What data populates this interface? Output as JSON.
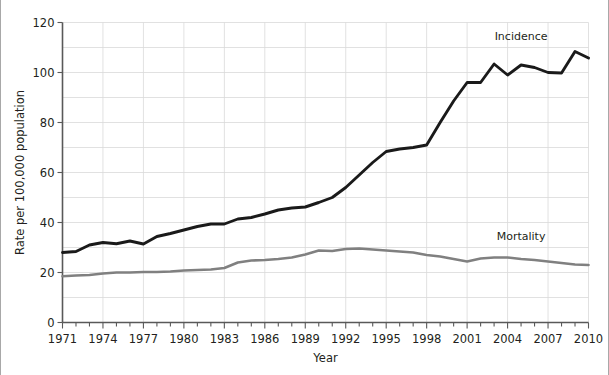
{
  "chart_data": {
    "type": "line",
    "title": "",
    "xlabel": "Year",
    "ylabel": "Rate per 100,000 population",
    "xlim": [
      1971,
      2010
    ],
    "ylim": [
      0,
      120
    ],
    "y_ticks": [
      0,
      20,
      40,
      60,
      80,
      100,
      120
    ],
    "y_gridlines": [
      10,
      20,
      30,
      40,
      50,
      60,
      70,
      80,
      90,
      100,
      110,
      120
    ],
    "y_tick_labels": [
      "0",
      "20",
      "40",
      "60",
      "80",
      "100",
      "120"
    ],
    "x_ticks": [
      1971,
      1972,
      1973,
      1974,
      1975,
      1976,
      1977,
      1978,
      1979,
      1980,
      1981,
      1982,
      1983,
      1984,
      1985,
      1986,
      1987,
      1988,
      1989,
      1990,
      1991,
      1992,
      1993,
      1994,
      1995,
      1996,
      1997,
      1998,
      1999,
      2000,
      2001,
      2002,
      2003,
      2004,
      2005,
      2006,
      2007,
      2008,
      2009,
      2010
    ],
    "x_tick_labels": [
      "1971",
      "1974",
      "1977",
      "1980",
      "1983",
      "1986",
      "1989",
      "1992",
      "1995",
      "1998",
      "2001",
      "2004",
      "2007",
      "2010"
    ],
    "x_labeled_ticks": [
      1971,
      1974,
      1977,
      1980,
      1983,
      1986,
      1989,
      1992,
      1995,
      1998,
      2001,
      2004,
      2007,
      2010
    ],
    "x_gridlines": [
      1971,
      1974,
      1977,
      1980,
      1983,
      1986,
      1989,
      1992,
      1995,
      1998,
      2001,
      2004,
      2007,
      2010
    ],
    "grid": true,
    "legend_position": "inline-annotation",
    "x": [
      1971,
      1972,
      1973,
      1974,
      1975,
      1976,
      1977,
      1978,
      1979,
      1980,
      1981,
      1982,
      1983,
      1984,
      1985,
      1986,
      1987,
      1988,
      1989,
      1990,
      1991,
      1992,
      1993,
      1994,
      1995,
      1996,
      1997,
      1998,
      1999,
      2000,
      2001,
      2002,
      2003,
      2004,
      2005,
      2006,
      2007,
      2008,
      2009,
      2010
    ],
    "series": [
      {
        "name": "Incidence",
        "color": "#1a1a1a",
        "values": [
          28.0,
          28.4,
          31.0,
          32.0,
          31.5,
          32.6,
          31.4,
          34.4,
          35.6,
          37.0,
          38.4,
          39.4,
          39.4,
          41.4,
          42.0,
          43.4,
          45.0,
          45.8,
          46.2,
          48.0,
          50.0,
          54.0,
          59.0,
          64.0,
          68.4,
          69.4,
          70.0,
          71.0,
          80.0,
          88.6,
          96.0,
          96.0,
          103.4,
          99.0,
          103.0,
          102.0,
          100.0,
          99.8,
          108.4,
          105.8
        ],
        "label_x": 2005,
        "label_y": 113
      },
      {
        "name": "Mortality",
        "color": "#808080",
        "values": [
          18.5,
          18.8,
          19.0,
          19.6,
          20.0,
          20.0,
          20.2,
          20.2,
          20.4,
          20.8,
          21.0,
          21.2,
          21.8,
          24.0,
          24.8,
          25.0,
          25.4,
          26.0,
          27.2,
          28.8,
          28.6,
          29.4,
          29.6,
          29.2,
          28.8,
          28.4,
          28.0,
          27.0,
          26.4,
          25.4,
          24.4,
          25.6,
          26.0,
          26.0,
          25.4,
          25.0,
          24.4,
          23.8,
          23.2,
          23.0
        ],
        "label_x": 2005,
        "label_y": 33
      }
    ]
  }
}
